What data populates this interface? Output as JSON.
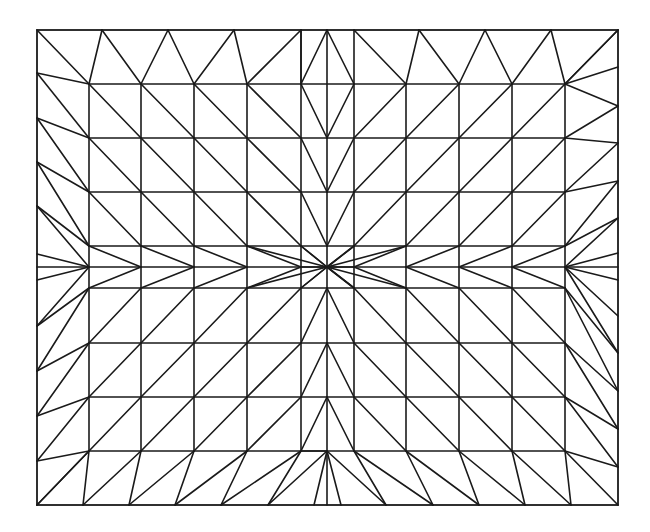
{
  "diagram": {
    "type": "triangular-mesh",
    "grid_columns": 13,
    "grid_rows": 11,
    "center_column_index": 6,
    "center_row_index": 5,
    "line_color": "#1a1a1a",
    "background_color": "#ffffff"
  }
}
